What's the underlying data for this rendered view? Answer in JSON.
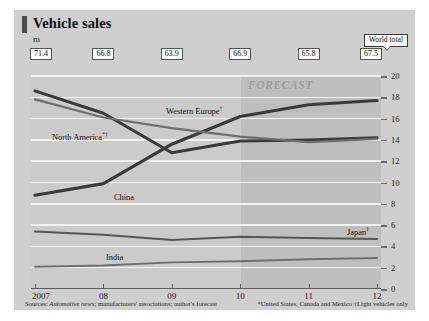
{
  "header": {
    "title": "Vehicle sales",
    "unit": "m",
    "world_total_label": "World total"
  },
  "footnotes": {
    "sources_prefix": "Sources:",
    "sources_italic": "Automotive news;",
    "sources_rest": " manufacturers' associations; author's forecast",
    "right": "*United States, Canada and Mexico †Light vehicles only"
  },
  "forecast": {
    "label": "FORECAST",
    "starts_at": "10"
  },
  "colors": {
    "figure_bg": "#cfcfcf",
    "plot_bg": "#cbcbcb",
    "forecast_bg": "#bebebe",
    "gridline": "#f2f2f2",
    "dark_series": "#3a3a3a",
    "mid_series": "#6e6e6e",
    "accent_bar": "#4a4a4a"
  },
  "chart_data": {
    "type": "line",
    "title": "Vehicle sales",
    "xlabel": "",
    "ylabel": "m",
    "ylim": [
      0,
      20
    ],
    "yticks": [
      0,
      2,
      4,
      6,
      8,
      10,
      12,
      14,
      16,
      18,
      20
    ],
    "grid": true,
    "legend": "inline-labels",
    "x": [
      "2007",
      "08",
      "09",
      "10",
      "11",
      "12"
    ],
    "xtick_labels": [
      "2007",
      "08",
      "09",
      "10",
      "11",
      "12"
    ],
    "world_total": {
      "label": "World total",
      "values": [
        71.4,
        66.8,
        63.9,
        66.9,
        65.8,
        67.5
      ]
    },
    "series": [
      {
        "name": "China",
        "label": "China",
        "values": [
          8.8,
          9.9,
          13.6,
          16.2,
          17.3,
          17.7
        ],
        "color": "#3a3a3a"
      },
      {
        "name": "North America",
        "label": "North America*†",
        "values": [
          18.6,
          16.5,
          12.8,
          13.9,
          14.0,
          14.2
        ],
        "color": "#3a3a3a"
      },
      {
        "name": "Western Europe",
        "label": "Western Europe†",
        "values": [
          17.8,
          16.1,
          15.1,
          14.3,
          13.8,
          14.1
        ],
        "color": "#6e6e6e"
      },
      {
        "name": "Japan",
        "label": "Japan†",
        "values": [
          5.4,
          5.1,
          4.6,
          4.9,
          4.8,
          4.7
        ],
        "color": "#555555"
      },
      {
        "name": "India",
        "label": "India",
        "values": [
          2.1,
          2.2,
          2.5,
          2.6,
          2.8,
          2.9
        ],
        "color": "#6e6e6e"
      }
    ]
  }
}
